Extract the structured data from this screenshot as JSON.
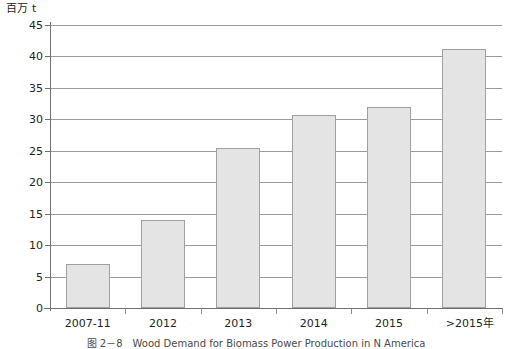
{
  "chart_data": {
    "type": "bar",
    "title": "",
    "subtitle": "",
    "xlabel": "年",
    "ylabel": "百万 t",
    "categories": [
      "2007-11",
      "2012",
      "2013",
      "2014",
      "2015",
      ">2015"
    ],
    "values": [
      7.0,
      14.0,
      25.5,
      30.7,
      32.0,
      41.2
    ],
    "series": [
      {
        "name": "Wood Demand",
        "values": [
          7.0,
          14.0,
          25.5,
          30.7,
          32.0,
          41.2
        ]
      }
    ],
    "ylim": [
      0,
      45
    ],
    "ytick_step": 5,
    "yticks": [
      0,
      5,
      10,
      15,
      20,
      25,
      30,
      35,
      40,
      45
    ],
    "ytick_labels": [
      "0",
      "5",
      "10",
      "15",
      "20",
      "25",
      "30",
      "35",
      "40",
      "45"
    ],
    "grid": true,
    "grid_axis": "y",
    "legend": false,
    "legend_position": "none",
    "bar_fill_color": "#e4e4e4",
    "bar_border_color": "#a0a0a0",
    "grid_color": "#9a9a9a",
    "axis_color": "#6f6f6f",
    "text_color": "#231f20"
  },
  "axes": {
    "y_unit_caption": "百万 t",
    "x_unit_caption": "年"
  },
  "caption": {
    "number": "图 2－8",
    "text": "Wood Demand for Biomass Power Production in N America"
  }
}
